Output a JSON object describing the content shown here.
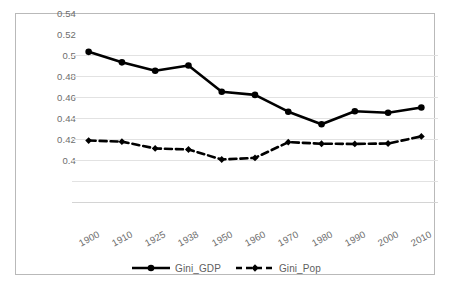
{
  "chart_data": {
    "type": "line",
    "title": "",
    "subtitle": "",
    "xlabel": "",
    "ylabel": "",
    "categories": [
      "1900",
      "1910",
      "1925",
      "1938",
      "1950",
      "1960",
      "1970",
      "1980",
      "1990",
      "2000",
      "2010"
    ],
    "series": [
      {
        "name": "Gini_GDP",
        "style": "solid",
        "color": "#000000",
        "marker": "circle",
        "values": [
          0.543,
          0.533,
          0.525,
          0.53,
          0.505,
          0.502,
          0.486,
          0.474,
          0.4865,
          0.485,
          0.49
        ]
      },
      {
        "name": "Gini_Pop",
        "style": "dashed",
        "color": "#000000",
        "marker": "diamond",
        "values": [
          0.4585,
          0.4575,
          0.451,
          0.45,
          0.4405,
          0.442,
          0.457,
          0.4555,
          0.4553,
          0.4557,
          0.4625
        ]
      }
    ],
    "ylim": [
      0.4,
      0.56
    ],
    "yticks": [
      0.54,
      0.52,
      0.5,
      0.48,
      0.46,
      0.44,
      0.42,
      0.4
    ],
    "ytick_labels": [
      "0.54",
      "0.52",
      "0.5",
      "0.48",
      "0.46",
      "0.44",
      "0.42",
      "0.4"
    ],
    "grid": true,
    "grid_axis": "y",
    "legend_position": "bottom",
    "legend": [
      "Gini_GDP",
      "Gini_Pop"
    ],
    "annotations": [],
    "border": true
  },
  "legend": {
    "entries": [
      {
        "label": "Gini_GDP"
      },
      {
        "label": "Gini_Pop"
      }
    ]
  },
  "colors": {
    "series": "#000000",
    "gridline": "#e2e2e2",
    "tick_text": "#6d6d6d",
    "frame_border": "#b9b9b9",
    "background": "#ffffff"
  }
}
